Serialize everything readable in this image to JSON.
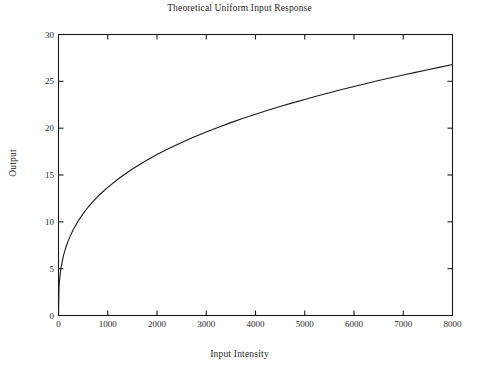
{
  "chart_data": {
    "type": "line",
    "title": "Theoretical Uniform Input Response",
    "xlabel": "Input Intensity",
    "ylabel": "Output",
    "xlim": [
      0,
      8000
    ],
    "ylim": [
      0,
      30
    ],
    "xticks": [
      0,
      1000,
      2000,
      3000,
      4000,
      5000,
      6000,
      7000,
      8000
    ],
    "xtick_labels": [
      "0",
      "1000",
      "2000",
      "3000",
      "4000",
      "5000",
      "6000",
      "7000",
      "8000"
    ],
    "yticks": [
      0,
      5,
      10,
      15,
      20,
      25,
      30
    ],
    "ytick_labels": [
      "0",
      "5",
      "10",
      "15",
      "20",
      "25",
      "30"
    ],
    "grid": false,
    "legend": null,
    "frame": "box",
    "tick_direction": "in",
    "line_color": "#1a1a1a",
    "background_color": "#ffffff",
    "series": [
      {
        "name": "Theoretical Uniform Input Response",
        "x": [
          0,
          10,
          25,
          50,
          100,
          150,
          200,
          300,
          400,
          500,
          600,
          700,
          800,
          900,
          1000,
          1250,
          1500,
          1750,
          2000,
          2250,
          2500,
          2750,
          3000,
          3250,
          3500,
          3750,
          4000,
          4250,
          4500,
          4750,
          5000,
          5250,
          5500,
          5750,
          6000,
          6250,
          6500,
          6750,
          7000,
          7250,
          7500,
          7750,
          8000
        ],
        "y": [
          0,
          2.98,
          4.02,
          5.06,
          6.37,
          7.29,
          8.02,
          9.18,
          10.1,
          10.88,
          11.56,
          12.16,
          12.71,
          13.21,
          13.68,
          14.73,
          15.64,
          16.45,
          17.18,
          17.85,
          18.47,
          19.05,
          19.59,
          20.1,
          20.59,
          21.05,
          21.49,
          21.91,
          22.31,
          22.7,
          23.07,
          23.43,
          23.78,
          24.12,
          24.45,
          24.77,
          25.08,
          25.38,
          25.68,
          25.96,
          26.24,
          26.52,
          26.79
        ]
      }
    ]
  }
}
